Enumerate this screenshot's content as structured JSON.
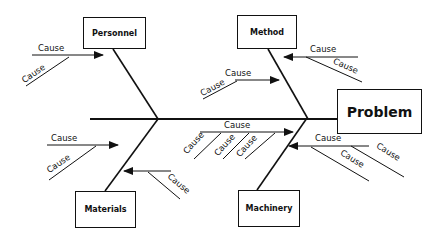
{
  "diagram": {
    "type": "fishbone",
    "problem": "Problem",
    "categories": [
      {
        "id": "personnel",
        "label": "Personnel",
        "causes": [
          "Cause",
          "Cause"
        ]
      },
      {
        "id": "method",
        "label": "Method",
        "causes": [
          "Cause",
          "Cause",
          "Cause",
          "Cause"
        ]
      },
      {
        "id": "materials",
        "label": "Materials",
        "causes": [
          "Cause",
          "Cause",
          "Cause"
        ]
      },
      {
        "id": "machinery",
        "label": "Machinery",
        "causes": [
          "Cause",
          "Cause",
          "Cause",
          "Cause",
          "Cause",
          "Cause"
        ]
      }
    ]
  }
}
